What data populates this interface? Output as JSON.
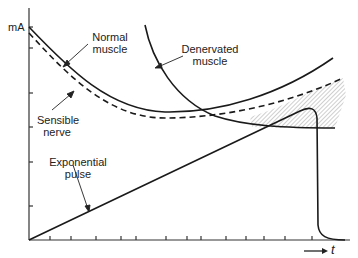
{
  "diagram": {
    "y_axis_label": "mA",
    "x_axis_label": "t",
    "x_axis_arrow": "→",
    "labels": {
      "normal_muscle_line1": "Normal",
      "normal_muscle_line2": "muscle",
      "sensible_nerve_line1": "Sensible",
      "sensible_nerve_line2": "nerve",
      "denervated_muscle_line1": "Denervated",
      "denervated_muscle_line2": "muscle",
      "exponential_pulse_line1": "Exponential",
      "exponential_pulse_line2": "pulse"
    },
    "curves": [
      {
        "name": "Normal muscle",
        "style": "solid"
      },
      {
        "name": "Sensible nerve",
        "style": "dashed"
      },
      {
        "name": "Denervated muscle",
        "style": "solid"
      },
      {
        "name": "Exponential pulse",
        "style": "solid"
      }
    ],
    "shaded_region": "hatched area between sensible nerve curve and denervated muscle curve near pulse peak",
    "colors": {
      "ink": "#1a1a1a",
      "background": "#ffffff",
      "hatch": "#888888"
    }
  }
}
